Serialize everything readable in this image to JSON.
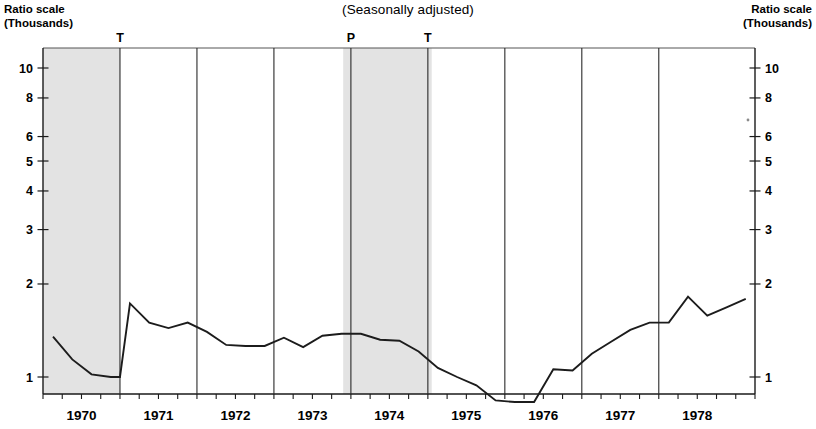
{
  "title": "(Seasonally adjusted)",
  "axis_labels": {
    "left_line1": "Ratio scale",
    "left_line2": "(Thousands)",
    "right_line1": "Ratio scale",
    "right_line2": "(Thousands)"
  },
  "markers": [
    {
      "label": "T",
      "x_year": 1970.5
    },
    {
      "label": "P",
      "x_year": 1973.5
    },
    {
      "label": "T",
      "x_year": 1974.5
    }
  ],
  "chart_data": {
    "type": "line",
    "title": "(Seasonally adjusted)",
    "xlabel": "",
    "ylabel": "Ratio scale (Thousands)",
    "yscale": "log",
    "ylim": [
      0.72,
      12.5
    ],
    "xlim": [
      1969.5,
      1978.75
    ],
    "grid": true,
    "legend": "none",
    "y_ticks": [
      1,
      2,
      3,
      4,
      5,
      6,
      8,
      10
    ],
    "y_tick_labels": [
      "1",
      "2",
      "3",
      "4",
      "5",
      "6",
      "8",
      "10"
    ],
    "x_ticks": [
      1970,
      1971,
      1972,
      1973,
      1974,
      1975,
      1976,
      1977,
      1978
    ],
    "x_tick_labels": [
      "1970",
      "1971",
      "1972",
      "1973",
      "1974",
      "1975",
      "1976",
      "1977",
      "1978"
    ],
    "x_minor_interval": 0.25,
    "gridline_positions": [
      1970.5,
      1971.5,
      1972.5,
      1973.5,
      1974.5,
      1975.5,
      1976.5,
      1977.5
    ],
    "shaded_bands": [
      {
        "start": 1969.5,
        "end": 1970.5,
        "label": "recession"
      },
      {
        "start": 1973.4,
        "end": 1974.55,
        "label": "recession"
      }
    ],
    "annotations": [
      {
        "text": "T",
        "x": 1970.5
      },
      {
        "text": "P",
        "x": 1973.5
      },
      {
        "text": "T",
        "x": 1974.5
      }
    ],
    "series": [
      {
        "name": "value",
        "x": [
          1969.63,
          1969.88,
          1970.13,
          1970.38,
          1970.5,
          1970.63,
          1970.88,
          1971.13,
          1971.38,
          1971.63,
          1971.88,
          1972.13,
          1972.38,
          1972.63,
          1972.88,
          1973.13,
          1973.38,
          1973.63,
          1973.88,
          1974.13,
          1974.38,
          1974.63,
          1974.88,
          1975.13,
          1975.38,
          1975.63,
          1975.88,
          1976.13,
          1976.38,
          1976.63,
          1976.88,
          1977.13,
          1977.38,
          1977.63,
          1977.88,
          1978.13,
          1978.38,
          1978.63
        ],
        "values": [
          1.35,
          1.14,
          1.02,
          1.0,
          1.0,
          1.73,
          1.5,
          1.44,
          1.5,
          1.4,
          1.27,
          1.26,
          1.26,
          1.34,
          1.25,
          1.36,
          1.38,
          1.38,
          1.32,
          1.31,
          1.21,
          1.07,
          1.0,
          0.94,
          0.84,
          0.83,
          0.83,
          1.06,
          1.05,
          1.19,
          1.3,
          1.42,
          1.5,
          1.5,
          1.82,
          1.58,
          1.68,
          1.79
        ]
      }
    ]
  }
}
